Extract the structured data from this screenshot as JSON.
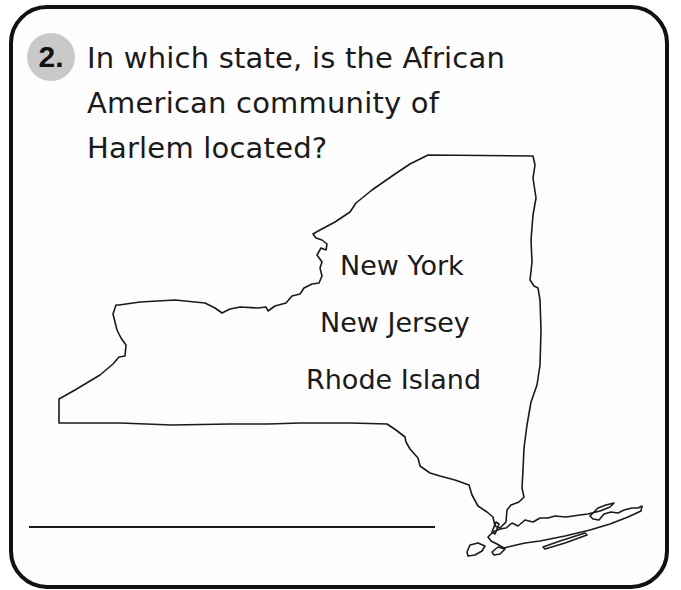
{
  "question": {
    "number": "2.",
    "lines": [
      "In which state, is the African",
      "American community of",
      "Harlem located?"
    ],
    "text": "In which state, is the African American community of Harlem located?"
  },
  "options": [
    {
      "label": "New York"
    },
    {
      "label": "New Jersey"
    },
    {
      "label": "Rhode Island"
    }
  ],
  "map": {
    "icon": "new-york-state-map-outline"
  },
  "answer_line": {
    "value": ""
  },
  "colors": {
    "border": "#111111",
    "badge": "#c9c9c9",
    "text": "#1a1a1a",
    "background": "#ffffff"
  }
}
